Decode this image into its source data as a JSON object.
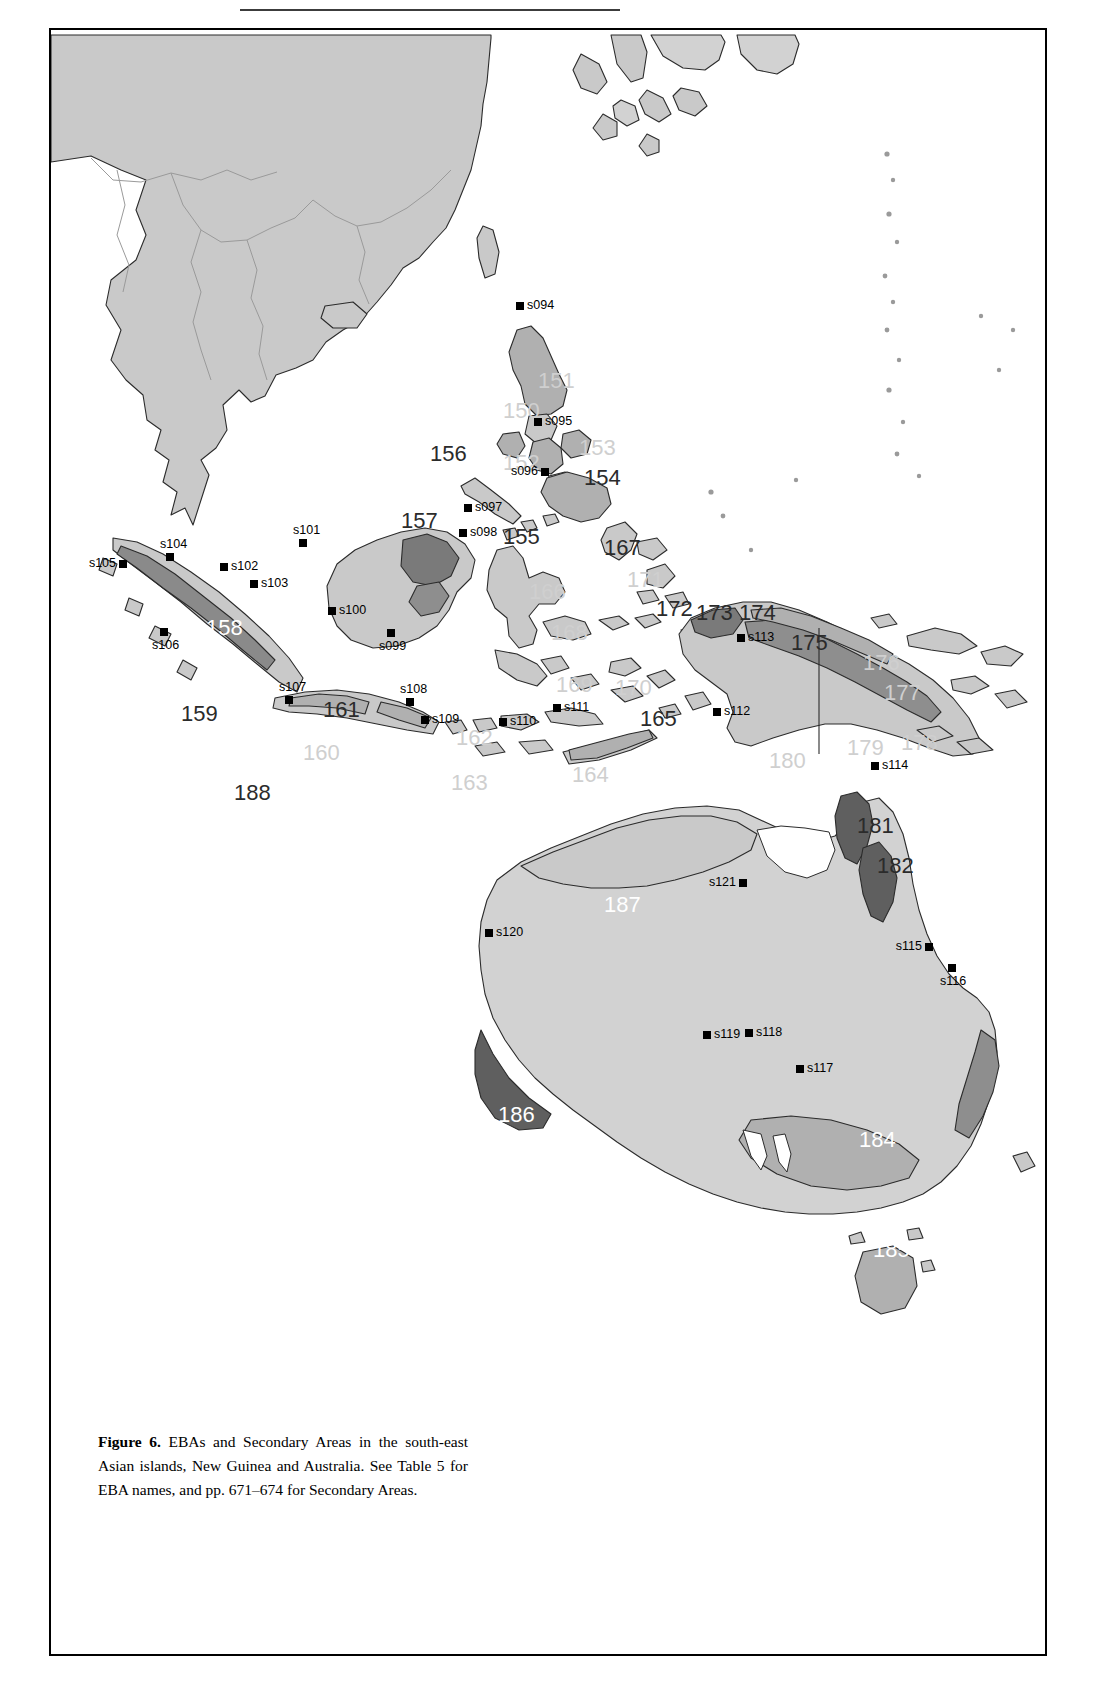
{
  "figure": {
    "caption_label": "Figure 6.",
    "caption_text": " EBAs and Secondary Areas in the south-east Asian islands, New Guinea and Australia. See Table 5 for EBA names, and pp. 671–674 for Secondary Areas."
  },
  "map": {
    "title": "EBAs and Secondary Areas in the south-east Asian islands, New Guinea and Australia",
    "colors": {
      "land": "#c9c9c9",
      "land_light": "#d8d8d8",
      "sea": "#ffffff",
      "eba_mid": "#b0b0b0",
      "eba_dark": "#7a7a7a",
      "outline": "#2b2b2b",
      "marker": "#000000"
    },
    "eba_labels": [
      {
        "id": "150",
        "text": "150",
        "x": 452,
        "y": 368,
        "size": 22,
        "tone": "grey"
      },
      {
        "id": "151",
        "text": "151",
        "x": 487,
        "y": 338,
        "size": 22,
        "tone": "grey"
      },
      {
        "id": "152",
        "text": "152",
        "x": 452,
        "y": 420,
        "size": 22,
        "tone": "grey"
      },
      {
        "id": "153",
        "text": "153",
        "x": 528,
        "y": 405,
        "size": 22,
        "tone": "grey"
      },
      {
        "id": "154",
        "text": "154",
        "x": 533,
        "y": 435,
        "size": 22,
        "tone": "dark"
      },
      {
        "id": "155",
        "text": "155",
        "x": 452,
        "y": 494,
        "size": 22,
        "tone": "dark"
      },
      {
        "id": "156",
        "text": "156",
        "x": 379,
        "y": 411,
        "size": 22,
        "tone": "dark"
      },
      {
        "id": "157",
        "text": "157",
        "x": 350,
        "y": 478,
        "size": 22,
        "tone": "dark"
      },
      {
        "id": "158",
        "text": "158",
        "x": 155,
        "y": 585,
        "size": 22,
        "tone": "white"
      },
      {
        "id": "159",
        "text": "159",
        "x": 130,
        "y": 671,
        "size": 22,
        "tone": "dark"
      },
      {
        "id": "160",
        "text": "160",
        "x": 252,
        "y": 710,
        "size": 22,
        "tone": "grey"
      },
      {
        "id": "161",
        "text": "161",
        "x": 272,
        "y": 667,
        "size": 22,
        "tone": "dark"
      },
      {
        "id": "162",
        "text": "162",
        "x": 405,
        "y": 695,
        "size": 22,
        "tone": "grey"
      },
      {
        "id": "163",
        "text": "163",
        "x": 400,
        "y": 740,
        "size": 22,
        "tone": "grey"
      },
      {
        "id": "164",
        "text": "164",
        "x": 521,
        "y": 732,
        "size": 22,
        "tone": "grey"
      },
      {
        "id": "165",
        "text": "165",
        "x": 589,
        "y": 676,
        "size": 22,
        "tone": "dark"
      },
      {
        "id": "166",
        "text": "166",
        "x": 478,
        "y": 549,
        "size": 22,
        "tone": "grey"
      },
      {
        "id": "167",
        "text": "167",
        "x": 553,
        "y": 505,
        "size": 22,
        "tone": "dark"
      },
      {
        "id": "168",
        "text": "168",
        "x": 500,
        "y": 590,
        "size": 22,
        "tone": "grey"
      },
      {
        "id": "169",
        "text": "169",
        "x": 505,
        "y": 642,
        "size": 22,
        "tone": "grey"
      },
      {
        "id": "170",
        "text": "170",
        "x": 564,
        "y": 645,
        "size": 22,
        "tone": "grey"
      },
      {
        "id": "171",
        "text": "171",
        "x": 576,
        "y": 537,
        "size": 22,
        "tone": "grey"
      },
      {
        "id": "172",
        "text": "172",
        "x": 605,
        "y": 566,
        "size": 22,
        "tone": "dark"
      },
      {
        "id": "173",
        "text": "173",
        "x": 645,
        "y": 570,
        "size": 22,
        "tone": "dark"
      },
      {
        "id": "174",
        "text": "174",
        "x": 688,
        "y": 570,
        "size": 22,
        "tone": "dark"
      },
      {
        "id": "175",
        "text": "175",
        "x": 740,
        "y": 600,
        "size": 22,
        "tone": "dark"
      },
      {
        "id": "176",
        "text": "176",
        "x": 812,
        "y": 620,
        "size": 22,
        "tone": "grey"
      },
      {
        "id": "177",
        "text": "177",
        "x": 833,
        "y": 650,
        "size": 22,
        "tone": "grey"
      },
      {
        "id": "178",
        "text": "178",
        "x": 850,
        "y": 700,
        "size": 22,
        "tone": "grey"
      },
      {
        "id": "179",
        "text": "179",
        "x": 796,
        "y": 705,
        "size": 22,
        "tone": "grey"
      },
      {
        "id": "180",
        "text": "180",
        "x": 718,
        "y": 718,
        "size": 22,
        "tone": "grey"
      },
      {
        "id": "181",
        "text": "181",
        "x": 806,
        "y": 783,
        "size": 22,
        "tone": "dark"
      },
      {
        "id": "182",
        "text": "182",
        "x": 826,
        "y": 823,
        "size": 22,
        "tone": "dark"
      },
      {
        "id": "183",
        "text": "183",
        "x": 999,
        "y": 1060,
        "size": 22,
        "tone": "white"
      },
      {
        "id": "184",
        "text": "184",
        "x": 808,
        "y": 1097,
        "size": 22,
        "tone": "white"
      },
      {
        "id": "185",
        "text": "185",
        "x": 822,
        "y": 1207,
        "size": 22,
        "tone": "white"
      },
      {
        "id": "186",
        "text": "186",
        "x": 447,
        "y": 1072,
        "size": 22,
        "tone": "white"
      },
      {
        "id": "187",
        "text": "187",
        "x": 553,
        "y": 862,
        "size": 22,
        "tone": "white"
      },
      {
        "id": "188",
        "text": "188",
        "x": 183,
        "y": 750,
        "size": 22,
        "tone": "dark"
      }
    ],
    "secondary_areas": [
      {
        "id": "s094",
        "label": "s094",
        "x": 469,
        "y": 276,
        "pos": "right"
      },
      {
        "id": "s095",
        "label": "s095",
        "x": 487,
        "y": 392,
        "pos": "right"
      },
      {
        "id": "s096",
        "label": "s096",
        "x": 494,
        "y": 442,
        "pos": "left"
      },
      {
        "id": "s097",
        "label": "s097",
        "x": 417,
        "y": 478,
        "pos": "right"
      },
      {
        "id": "s098",
        "label": "s098",
        "x": 412,
        "y": 503,
        "pos": "right"
      },
      {
        "id": "s099",
        "label": "s099",
        "x": 340,
        "y": 603,
        "pos": "below"
      },
      {
        "id": "s100",
        "label": "s100",
        "x": 281,
        "y": 581,
        "pos": "right"
      },
      {
        "id": "s101",
        "label": "s101",
        "x": 252,
        "y": 513,
        "pos": "above"
      },
      {
        "id": "s102",
        "label": "s102",
        "x": 173,
        "y": 537,
        "pos": "right"
      },
      {
        "id": "s103",
        "label": "s103",
        "x": 203,
        "y": 554,
        "pos": "right"
      },
      {
        "id": "s104",
        "label": "s104",
        "x": 119,
        "y": 527,
        "pos": "above"
      },
      {
        "id": "s105",
        "label": "s105",
        "x": 72,
        "y": 534,
        "pos": "left"
      },
      {
        "id": "s106",
        "label": "s106",
        "x": 113,
        "y": 602,
        "pos": "below"
      },
      {
        "id": "s107",
        "label": "s107",
        "x": 238,
        "y": 670,
        "pos": "above"
      },
      {
        "id": "s108",
        "label": "s108",
        "x": 359,
        "y": 672,
        "pos": "above"
      },
      {
        "id": "s109",
        "label": "s109",
        "x": 374,
        "y": 690,
        "pos": "right"
      },
      {
        "id": "s110",
        "label": "s110",
        "x": 452,
        "y": 692,
        "pos": "right"
      },
      {
        "id": "s111",
        "label": "s111",
        "x": 506,
        "y": 678,
        "pos": "right"
      },
      {
        "id": "s112",
        "label": "s112",
        "x": 666,
        "y": 682,
        "pos": "right"
      },
      {
        "id": "s113",
        "label": "s113",
        "x": 690,
        "y": 608,
        "pos": "right"
      },
      {
        "id": "s114",
        "label": "s114",
        "x": 824,
        "y": 736,
        "pos": "right"
      },
      {
        "id": "s115",
        "label": "s115",
        "x": 878,
        "y": 917,
        "pos": "left"
      },
      {
        "id": "s116",
        "label": "s116",
        "x": 901,
        "y": 938,
        "pos": "below"
      },
      {
        "id": "s117",
        "label": "s117",
        "x": 749,
        "y": 1039,
        "pos": "right"
      },
      {
        "id": "s118",
        "label": "s118",
        "x": 698,
        "y": 1003,
        "pos": "right"
      },
      {
        "id": "s119",
        "label": "s119",
        "x": 656,
        "y": 1005,
        "pos": "right"
      },
      {
        "id": "s120",
        "label": "s120",
        "x": 438,
        "y": 903,
        "pos": "right"
      },
      {
        "id": "s121",
        "label": "s121",
        "x": 692,
        "y": 853,
        "pos": "left"
      }
    ]
  }
}
